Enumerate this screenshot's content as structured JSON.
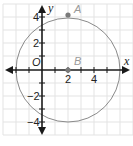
{
  "diagram": {
    "type": "coordinate-plane",
    "x_axis_label": "x",
    "y_axis_label": "y",
    "origin_label": "O",
    "x_tick_labels": [
      "2",
      "4"
    ],
    "y_tick_labels": [
      "4",
      "2",
      "−2",
      "−4"
    ],
    "points": [
      {
        "label": "A",
        "x": 2,
        "y": 4
      },
      {
        "label": "B",
        "x": 2,
        "y": 0
      }
    ],
    "circle": {
      "center": "B",
      "center_x": 2,
      "center_y": 0,
      "radius": 4
    },
    "colors": {
      "grid": "#e3e3e3",
      "axis": "#1a1a1a",
      "circle": "#8a8a8a",
      "point": "#7a7a7a"
    }
  }
}
